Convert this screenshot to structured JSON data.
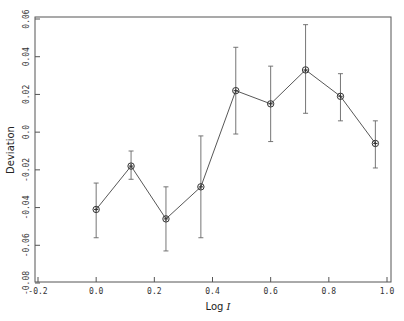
{
  "chart_data": {
    "type": "line",
    "title": "",
    "xlabel": "Log",
    "xlabel_italic_suffix": "I",
    "ylabel": "Deviation",
    "xlim": [
      -0.2,
      1.0
    ],
    "ylim": [
      -0.08,
      0.06
    ],
    "x_ticks": [
      -0.2,
      0.0,
      0.2,
      0.4,
      0.6,
      0.8,
      1.0
    ],
    "x_tick_labels": [
      "-0.2",
      "0.0",
      "0.2",
      "0.4",
      "0.6",
      "0.8",
      "1.0"
    ],
    "y_ticks": [
      -0.08,
      -0.06,
      -0.04,
      -0.02,
      0.0,
      0.02,
      0.04,
      0.06
    ],
    "y_tick_labels": [
      "-0.08",
      "-0.06",
      "-0.04",
      "-0.02",
      "0.0",
      "0.02",
      "0.04",
      "0.06"
    ],
    "grid": false,
    "legend": null,
    "marker": "circle-with-cross",
    "error_bars": true,
    "series": [
      {
        "name": "Deviation",
        "x": [
          0.0,
          0.12,
          0.24,
          0.36,
          0.48,
          0.6,
          0.72,
          0.84,
          0.96
        ],
        "y": [
          -0.041,
          -0.018,
          -0.046,
          -0.029,
          0.022,
          0.015,
          0.033,
          0.019,
          -0.006
        ],
        "y_upper": [
          -0.027,
          -0.01,
          -0.029,
          -0.002,
          0.045,
          0.035,
          0.057,
          0.031,
          0.006
        ],
        "y_lower": [
          -0.056,
          -0.025,
          -0.063,
          -0.056,
          -0.001,
          -0.005,
          0.01,
          0.006,
          -0.019
        ]
      }
    ]
  },
  "colors": {
    "axis": "#555555",
    "line": "#444444",
    "errorbar": "#666666",
    "background": "#ffffff"
  }
}
